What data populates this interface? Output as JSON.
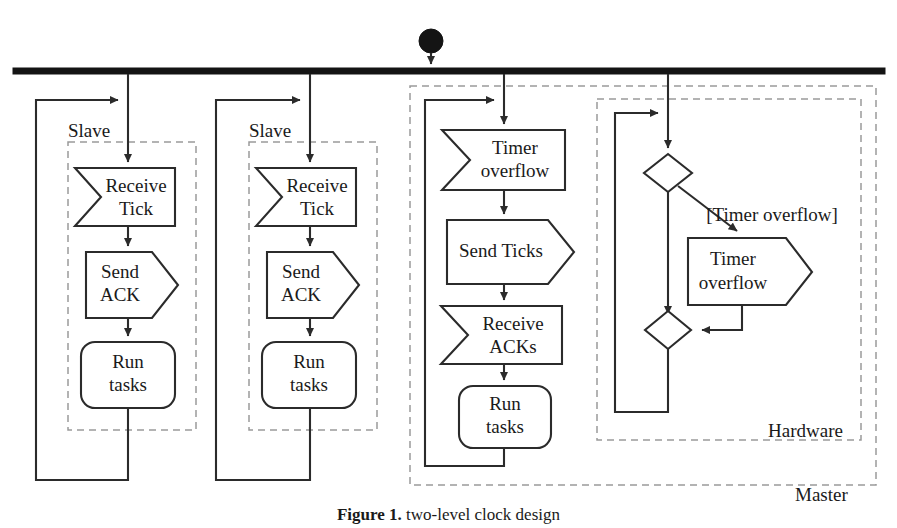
{
  "figure": {
    "caption_label": "Figure 1.",
    "caption_text": "  two-level clock design",
    "initial_node": "initial-node",
    "fork_bar": "fork-bar"
  },
  "lanes": [
    {
      "id": "slave-1",
      "label": "Slave"
    },
    {
      "id": "slave-2",
      "label": "Slave"
    },
    {
      "id": "master",
      "label": "Master"
    },
    {
      "id": "hardware",
      "label": "Hardware"
    }
  ],
  "slave_1": {
    "label": "Slave",
    "nodes": [
      {
        "id": "receive-tick",
        "type": "receive-signal",
        "line1": "Receive",
        "line2": "Tick"
      },
      {
        "id": "send-ack",
        "type": "send-signal",
        "line1": "Send",
        "line2": "ACK"
      },
      {
        "id": "run-tasks",
        "type": "action",
        "line1": "Run",
        "line2": "tasks"
      }
    ]
  },
  "slave_2": {
    "label": "Slave",
    "nodes": [
      {
        "id": "receive-tick",
        "type": "receive-signal",
        "line1": "Receive",
        "line2": "Tick"
      },
      {
        "id": "send-ack",
        "type": "send-signal",
        "line1": "Send",
        "line2": "ACK"
      },
      {
        "id": "run-tasks",
        "type": "action",
        "line1": "Run",
        "line2": "tasks"
      }
    ]
  },
  "master": {
    "label": "Master",
    "nodes": [
      {
        "id": "timer-overflow-receive",
        "type": "receive-signal",
        "line1": "Timer",
        "line2": "overflow"
      },
      {
        "id": "send-ticks",
        "type": "send-signal",
        "line1": "Send Ticks",
        "line2": ""
      },
      {
        "id": "receive-acks",
        "type": "receive-signal",
        "line1": "Receive",
        "line2": "ACKs"
      },
      {
        "id": "run-tasks",
        "type": "action",
        "line1": "Run",
        "line2": "tasks"
      }
    ]
  },
  "hardware": {
    "label": "Hardware",
    "guard": "[Timer overflow]",
    "nodes": [
      {
        "id": "decision",
        "type": "decision",
        "line1": "",
        "line2": ""
      },
      {
        "id": "timer-overflow-send",
        "type": "send-signal",
        "line1": "Timer",
        "line2": "overflow"
      },
      {
        "id": "merge",
        "type": "merge",
        "line1": "",
        "line2": ""
      }
    ]
  }
}
